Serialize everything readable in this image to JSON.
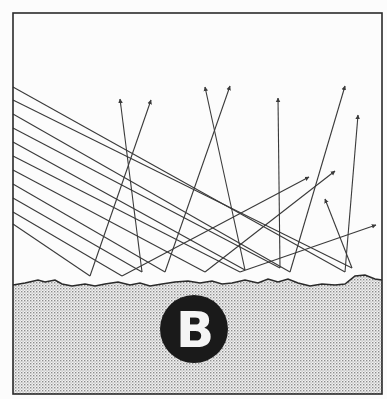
{
  "figure": {
    "logo_letter": "B",
    "colors": {
      "background": "#fcfcfc",
      "ink": "#3a3a3a",
      "frame": "#2a2a2a",
      "surface_dots": "#9a9a9a",
      "logo_circle": "#1a1a1a",
      "logo_letter": "#f4f4f4"
    },
    "frame": {
      "x1": 13,
      "y1": 13,
      "x2": 382,
      "y2": 394
    },
    "incident_rays": [
      {
        "x1": 13,
        "y1": 87,
        "x2": 345,
        "y2": 272
      },
      {
        "x1": 13,
        "y1": 100,
        "x2": 352,
        "y2": 268
      },
      {
        "x1": 13,
        "y1": 114,
        "x2": 290,
        "y2": 272
      },
      {
        "x1": 13,
        "y1": 128,
        "x2": 280,
        "y2": 268
      },
      {
        "x1": 13,
        "y1": 142,
        "x2": 245,
        "y2": 270
      },
      {
        "x1": 13,
        "y1": 156,
        "x2": 240,
        "y2": 272
      },
      {
        "x1": 13,
        "y1": 170,
        "x2": 205,
        "y2": 272
      },
      {
        "x1": 13,
        "y1": 184,
        "x2": 165,
        "y2": 272
      },
      {
        "x1": 13,
        "y1": 198,
        "x2": 142,
        "y2": 272
      },
      {
        "x1": 13,
        "y1": 212,
        "x2": 122,
        "y2": 276
      },
      {
        "x1": 13,
        "y1": 224,
        "x2": 90,
        "y2": 276
      }
    ],
    "reflected_rays": [
      {
        "x1": 90,
        "y1": 276,
        "x2": 151,
        "y2": 100
      },
      {
        "x1": 142,
        "y1": 272,
        "x2": 120,
        "y2": 99
      },
      {
        "x1": 165,
        "y1": 272,
        "x2": 230,
        "y2": 86
      },
      {
        "x1": 245,
        "y1": 270,
        "x2": 205,
        "y2": 87
      },
      {
        "x1": 280,
        "y1": 268,
        "x2": 278,
        "y2": 98
      },
      {
        "x1": 122,
        "y1": 276,
        "x2": 309,
        "y2": 177
      },
      {
        "x1": 205,
        "y1": 272,
        "x2": 335,
        "y2": 171
      },
      {
        "x1": 290,
        "y1": 272,
        "x2": 345,
        "y2": 86
      },
      {
        "x1": 345,
        "y1": 272,
        "x2": 358,
        "y2": 115
      },
      {
        "x1": 352,
        "y1": 268,
        "x2": 325,
        "y2": 199
      },
      {
        "x1": 240,
        "y1": 272,
        "x2": 376,
        "y2": 225
      }
    ],
    "surface_profile": [
      [
        13,
        285
      ],
      [
        25,
        283
      ],
      [
        38,
        280
      ],
      [
        45,
        282
      ],
      [
        55,
        280
      ],
      [
        62,
        284
      ],
      [
        72,
        286
      ],
      [
        85,
        284
      ],
      [
        95,
        286
      ],
      [
        105,
        284
      ],
      [
        118,
        282
      ],
      [
        130,
        285
      ],
      [
        140,
        283
      ],
      [
        150,
        286
      ],
      [
        162,
        284
      ],
      [
        175,
        282
      ],
      [
        188,
        281
      ],
      [
        200,
        283
      ],
      [
        212,
        281
      ],
      [
        222,
        284
      ],
      [
        232,
        283
      ],
      [
        245,
        280
      ],
      [
        258,
        283
      ],
      [
        268,
        279
      ],
      [
        278,
        282
      ],
      [
        288,
        279
      ],
      [
        298,
        283
      ],
      [
        310,
        286
      ],
      [
        322,
        284
      ],
      [
        335,
        285
      ],
      [
        345,
        284
      ],
      [
        355,
        276
      ],
      [
        365,
        275
      ],
      [
        375,
        279
      ],
      [
        382,
        280
      ]
    ],
    "logo": {
      "cx": 194,
      "cy": 329,
      "r": 34
    }
  }
}
